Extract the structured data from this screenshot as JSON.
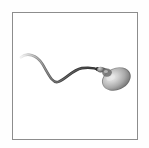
{
  "figure": {
    "caption": "",
    "background_color": "#ffffff",
    "outer_background_color": "#fefefe",
    "frame": {
      "border_color": "#8d8d8d",
      "border_width_px": 1,
      "x": 12,
      "y": 12,
      "width": 126,
      "height": 128
    },
    "subject": {
      "name": "spermatozoon",
      "style": "greyscale shaded render",
      "head": {
        "shape": "ellipse",
        "center_x": 117,
        "center_y": 79,
        "radius_x": 15,
        "radius_y": 11,
        "rotation_deg": -24,
        "fill_light": "#d8d8d8",
        "fill_mid": "#9e9e9e",
        "fill_dark": "#5d5d5d",
        "outline_color": "#6a6a6a",
        "highlight_color": "#ededed"
      },
      "midpiece": {
        "shape": "tapered neck",
        "start_x": 96,
        "start_y": 69,
        "end_x": 106,
        "end_y": 72,
        "color_dark": "#3a3a3a",
        "color_light": "#b4b4b4"
      },
      "tail": {
        "shape": "sinusoidal flagellum",
        "stroke_dark": "#2f2f2f",
        "stroke_fade": "#e3e3e3",
        "start_x": 20,
        "start_y": 57,
        "end_x": 99,
        "end_y": 70,
        "thickness_start_px": 0.6,
        "thickness_end_px": 3.2,
        "waypoints": [
          {
            "x": 20,
            "y": 57
          },
          {
            "x": 31,
            "y": 53
          },
          {
            "x": 45,
            "y": 68
          },
          {
            "x": 57,
            "y": 82
          },
          {
            "x": 71,
            "y": 76
          },
          {
            "x": 84,
            "y": 68
          },
          {
            "x": 99,
            "y": 70
          }
        ]
      }
    }
  }
}
